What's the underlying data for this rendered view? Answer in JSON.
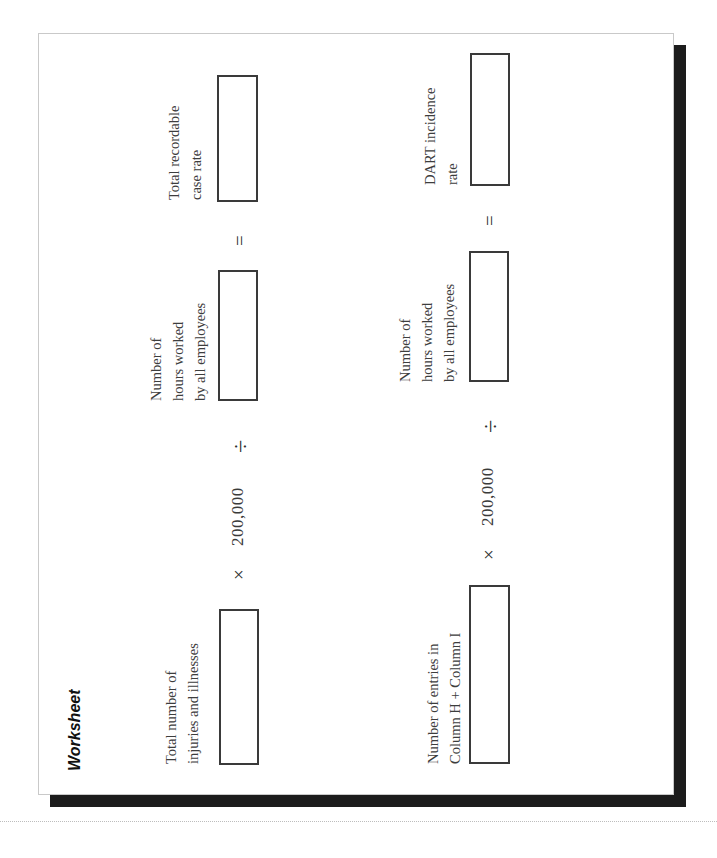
{
  "worksheet": {
    "title": "Worksheet",
    "rows": [
      {
        "input1_label": [
          "Total number of",
          "injuries and illnesses"
        ],
        "multiply_symbol": "×",
        "constant": "200,000",
        "divide_symbol": "÷",
        "input2_label": [
          "Number of",
          "hours worked",
          "by all employees"
        ],
        "equals_symbol": "=",
        "result_label": [
          "Total recordable",
          "case rate"
        ]
      },
      {
        "input1_label": [
          "Number of entries in",
          "Column H + Column I"
        ],
        "multiply_symbol": "×",
        "constant": "200,000",
        "divide_symbol": "÷",
        "input2_label": [
          "Number of",
          "hours worked",
          "by all employees"
        ],
        "equals_symbol": "=",
        "result_label": [
          "DART incidence",
          "rate"
        ]
      }
    ]
  },
  "colors": {
    "page_border": "#c9c9c9",
    "shadow": "#1c1c1c",
    "box_border": "#3a3a3a"
  }
}
